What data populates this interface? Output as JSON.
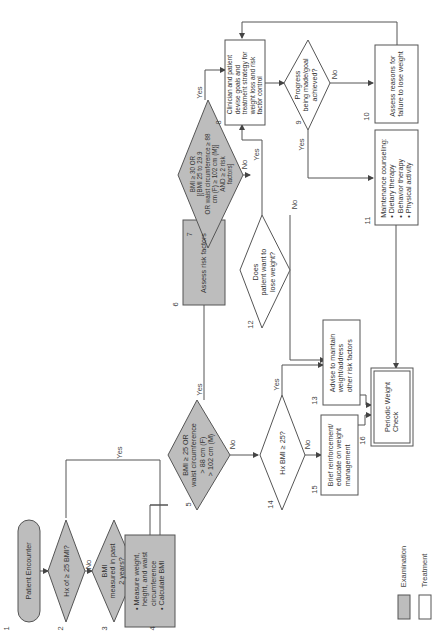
{
  "colors": {
    "exam_fill": "#bdbdbd",
    "treat_fill": "#ffffff",
    "stroke": "#555555"
  },
  "nodes": {
    "n1": {
      "num": "1",
      "text": "Patient Encounter"
    },
    "n2": {
      "num": "2",
      "text": "Hx of ≥ 25 BMI?"
    },
    "n3": {
      "num": "3",
      "text": "BMI\nmeasured in past\n2 years?"
    },
    "n4": {
      "num": "4",
      "text": "• Measure weight,\n  height, and waist\n  circumference\n• Calculate BMI"
    },
    "n5": {
      "num": "5",
      "text": "BMI ≥ 25 OR\nwaist circumference\n> 88 cm (F)\n> 102 cm (M)"
    },
    "n6": {
      "num": "6",
      "text": "Assess risk factors"
    },
    "n7": {
      "num": "7",
      "text": "BMI ≥ 30 OR\n[(BMI 25 to 29.9\nOR waist circumference ≥ 88\ncm (F) ≥ 102 cm (M)]\nAND ≥ 2 risk\nfactors]"
    },
    "n8": {
      "num": "8",
      "text": "Clinician and patient\ndevise goals and\ntreatment strategy for\nweight loss and risk\nfactor control"
    },
    "n9": {
      "num": "9",
      "text": "Progress\nbeing made/goal\nachieved?"
    },
    "n10": {
      "num": "10",
      "text": "Assess reasons for\nfailure to lose weight"
    },
    "n11": {
      "num": "11",
      "text": "Maintenance counseling:\n• Dietary therapy\n• Behavior therapy\n• Physical activity"
    },
    "n12": {
      "num": "12",
      "text": "Does\npatient want to\nlose weight?"
    },
    "n13": {
      "num": "13",
      "text": "Advise to maintain\nweight/address\nother risk factors"
    },
    "n14": {
      "num": "14",
      "text": "Hx BMI ≥ 25?"
    },
    "n15": {
      "num": "15",
      "text": "Brief reinforcement/\neducate on weight\nmanagement"
    },
    "n16": {
      "num": "16",
      "text": "Periodic Weight\nCheck"
    }
  },
  "edge_labels": {
    "yes": "Yes",
    "no": "No"
  },
  "legend": {
    "examination": "Examination",
    "treatment": "Treatment"
  }
}
